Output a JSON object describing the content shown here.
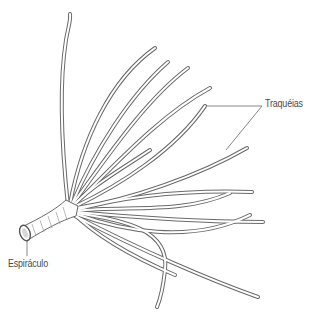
{
  "figure": {
    "labels": {
      "tracheae": "Traquéias",
      "spiracle": "Espiráculo"
    },
    "caption": "",
    "colors": {
      "line": "#6a6a6a",
      "label_text": "#4a4a4a",
      "background": "#ffffff"
    }
  }
}
